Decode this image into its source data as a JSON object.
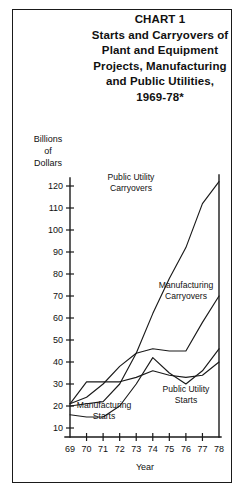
{
  "title": {
    "line1": "CHART 1",
    "line2": "Starts and Carryovers of",
    "line3": "Plant and Equipment",
    "line4": "Projects, Manufacturing",
    "line5": "and Public Utilities,",
    "line6": "1969-78*"
  },
  "chart_data": {
    "type": "line",
    "xlabel": "Year",
    "ylabel": "Billions of Dollars",
    "ylabel_lines": [
      "Billions",
      "of",
      "Dollars"
    ],
    "x": [
      69,
      70,
      71,
      72,
      73,
      74,
      75,
      76,
      77,
      78
    ],
    "xtick_labels": [
      "69",
      "70",
      "71",
      "72",
      "73",
      "74",
      "75",
      "76",
      "77",
      "78"
    ],
    "ytick_labels": [
      "10",
      "20",
      "30",
      "40",
      "50",
      "60",
      "70",
      "80",
      "90",
      "100",
      "110",
      "120"
    ],
    "ytick_values": [
      10,
      20,
      30,
      40,
      50,
      60,
      70,
      80,
      90,
      100,
      110,
      120
    ],
    "xlim": [
      69,
      78
    ],
    "ylim": [
      0,
      125
    ],
    "grid": false,
    "legend": "inline-labels",
    "series": [
      {
        "name": "Public Utility Carryovers",
        "label_lines": [
          "Public Utility",
          "Carryovers"
        ],
        "values": [
          20,
          21,
          22,
          30,
          44,
          62,
          78,
          92,
          112,
          122
        ]
      },
      {
        "name": "Manufacturing Carryovers",
        "label_lines": [
          "Manufacturing",
          "Carryovers"
        ],
        "values": [
          21,
          24,
          30,
          38,
          44,
          46,
          45,
          45,
          58,
          70
        ]
      },
      {
        "name": "Public Utility Starts",
        "label_lines": [
          "Public Utility",
          "Starts"
        ],
        "values": [
          21,
          31,
          31,
          31,
          33,
          36,
          34,
          33,
          34,
          40
        ]
      },
      {
        "name": "Manufacturing Starts",
        "label_lines": [
          "Manufacturing",
          "Starts"
        ],
        "values": [
          16,
          15,
          15,
          20,
          30,
          42,
          35,
          30,
          36,
          46
        ]
      }
    ]
  }
}
